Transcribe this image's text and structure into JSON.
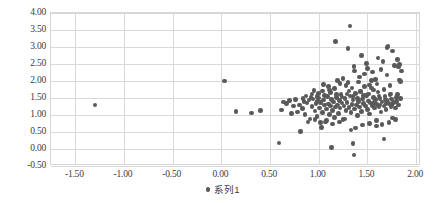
{
  "chart_data": {
    "type": "scatter",
    "title": "",
    "xlabel": "",
    "ylabel": "",
    "xlim": [
      -1.75,
      2.05
    ],
    "ylim": [
      -0.5,
      4.0
    ],
    "grid": true,
    "legend_position": "bottom",
    "marker_color": "#595959",
    "gridline_color": "#d9d9d9",
    "plot_border_color": "#d6d6d6",
    "background_color": "#ffffff",
    "x_ticks": [
      "-1.50",
      "-1.00",
      "-0.50",
      "0.00",
      "0.50",
      "1.00",
      "1.50",
      "2.00"
    ],
    "x_tick_values": [
      -1.5,
      -1.0,
      -0.5,
      0.0,
      0.5,
      1.0,
      1.5,
      2.0
    ],
    "y_ticks": [
      "4.00",
      "3.50",
      "3.00",
      "2.50",
      "2.00",
      "1.50",
      "1.00",
      "0.50",
      "0.00",
      "-0.50"
    ],
    "y_tick_values": [
      4.0,
      3.5,
      3.0,
      2.5,
      2.0,
      1.5,
      1.0,
      0.5,
      0.0,
      -0.5
    ],
    "series": [
      {
        "name": "系列1",
        "marker": "circle",
        "color": "#595959",
        "points": [
          [
            -1.3,
            1.29
          ],
          [
            0.03,
            2.0
          ],
          [
            0.15,
            1.11
          ],
          [
            0.31,
            1.06
          ],
          [
            0.4,
            1.13
          ],
          [
            0.59,
            0.18
          ],
          [
            0.62,
            1.15
          ],
          [
            0.64,
            1.38
          ],
          [
            0.67,
            1.33
          ],
          [
            0.7,
            1.42
          ],
          [
            0.72,
            1.05
          ],
          [
            0.74,
            1.27
          ],
          [
            0.76,
            1.45
          ],
          [
            0.78,
            1.09
          ],
          [
            0.8,
            1.3
          ],
          [
            0.81,
            0.52
          ],
          [
            0.83,
            1.19
          ],
          [
            0.85,
            1.4
          ],
          [
            0.86,
            1.02
          ],
          [
            0.88,
            1.35
          ],
          [
            0.9,
            1.44
          ],
          [
            0.91,
            0.88
          ],
          [
            0.93,
            1.25
          ],
          [
            0.94,
            1.47
          ],
          [
            0.95,
            1.72
          ],
          [
            0.96,
            1.12
          ],
          [
            0.97,
            1.33
          ],
          [
            0.98,
            0.95
          ],
          [
            0.99,
            1.41
          ],
          [
            1.0,
            1.5
          ],
          [
            1.01,
            1.21
          ],
          [
            1.02,
            1.36
          ],
          [
            1.03,
            0.64
          ],
          [
            1.04,
            1.08
          ],
          [
            1.05,
            1.44
          ],
          [
            1.06,
            1.29
          ],
          [
            1.07,
            0.79
          ],
          [
            1.08,
            1.18
          ],
          [
            1.09,
            1.55
          ],
          [
            1.1,
            1.32
          ],
          [
            1.11,
            1.01
          ],
          [
            1.12,
            1.26
          ],
          [
            1.13,
            1.46
          ],
          [
            1.13,
            0.04
          ],
          [
            1.14,
            1.14
          ],
          [
            1.15,
            1.38
          ],
          [
            1.16,
            0.92
          ],
          [
            1.17,
            1.24
          ],
          [
            1.17,
            3.16
          ],
          [
            1.18,
            1.51
          ],
          [
            1.19,
            1.3
          ],
          [
            1.2,
            1.05
          ],
          [
            1.21,
            1.43
          ],
          [
            1.22,
            1.2
          ],
          [
            1.23,
            1.61
          ],
          [
            1.24,
            1.35
          ],
          [
            1.25,
            0.86
          ],
          [
            1.26,
            1.27
          ],
          [
            1.27,
            1.48
          ],
          [
            1.28,
            1.13
          ],
          [
            1.29,
            1.37
          ],
          [
            1.3,
            1.95
          ],
          [
            1.31,
            1.22
          ],
          [
            1.32,
            1.56
          ],
          [
            1.32,
            3.62
          ],
          [
            1.33,
            1.07
          ],
          [
            1.34,
            1.31
          ],
          [
            1.35,
            1.44
          ],
          [
            1.35,
            0.17
          ],
          [
            1.36,
            -0.18
          ],
          [
            1.37,
            1.18
          ],
          [
            1.38,
            1.64
          ],
          [
            1.39,
            1.29
          ],
          [
            1.4,
            0.98
          ],
          [
            1.41,
            1.39
          ],
          [
            1.42,
            1.24
          ],
          [
            1.43,
            1.7
          ],
          [
            1.44,
            1.11
          ],
          [
            1.45,
            1.47
          ],
          [
            1.46,
            1.33
          ],
          [
            1.47,
            2.2
          ],
          [
            1.48,
            1.26
          ],
          [
            1.49,
            1.58
          ],
          [
            1.5,
            1.16
          ],
          [
            1.51,
            1.41
          ],
          [
            1.52,
            1.03
          ],
          [
            1.53,
            1.35
          ],
          [
            1.54,
            1.79
          ],
          [
            1.55,
            1.28
          ],
          [
            1.56,
            1.52
          ],
          [
            1.57,
            1.2
          ],
          [
            1.58,
            1.45
          ],
          [
            1.59,
            0.84
          ],
          [
            1.6,
            1.31
          ],
          [
            1.61,
            1.68
          ],
          [
            1.62,
            1.23
          ],
          [
            1.63,
            1.49
          ],
          [
            1.64,
            1.09
          ],
          [
            1.65,
            1.38
          ],
          [
            1.66,
            2.57
          ],
          [
            1.67,
            1.27
          ],
          [
            1.67,
            0.29
          ],
          [
            1.68,
            1.54
          ],
          [
            1.69,
            1.17
          ],
          [
            1.7,
            1.42
          ],
          [
            1.71,
            3.02
          ],
          [
            1.72,
            1.33
          ],
          [
            1.73,
            1.6
          ],
          [
            1.74,
            1.25
          ],
          [
            1.75,
            1.47
          ],
          [
            1.76,
            0.91
          ],
          [
            1.77,
            1.36
          ],
          [
            1.78,
            2.45
          ],
          [
            1.79,
            1.21
          ],
          [
            1.8,
            1.51
          ],
          [
            1.81,
            2.63
          ],
          [
            1.82,
            1.3
          ],
          [
            1.83,
            2.03
          ],
          [
            1.84,
            1.99
          ],
          [
            1.85,
            2.29
          ],
          [
            1.3,
            2.95
          ],
          [
            1.36,
            2.43
          ],
          [
            1.42,
            2.12
          ],
          [
            1.49,
            2.51
          ],
          [
            1.55,
            2.27
          ],
          [
            1.61,
            2.68
          ],
          [
            1.44,
            2.75
          ],
          [
            1.52,
            1.88
          ],
          [
            1.58,
            2.05
          ],
          [
            1.64,
            2.34
          ],
          [
            1.7,
            2.18
          ],
          [
            1.76,
            2.88
          ],
          [
            1.82,
            2.41
          ],
          [
            1.73,
            1.86
          ],
          [
            1.67,
            1.75
          ],
          [
            1.6,
            1.91
          ],
          [
            1.54,
            2.02
          ],
          [
            1.47,
            1.83
          ],
          [
            1.41,
            1.97
          ],
          [
            1.34,
            1.79
          ],
          [
            1.28,
            1.86
          ],
          [
            1.22,
            1.93
          ],
          [
            1.16,
            1.78
          ],
          [
            1.1,
            1.84
          ],
          [
            1.05,
            1.9
          ],
          [
            1.19,
            2.01
          ],
          [
            1.25,
            2.08
          ],
          [
            1.31,
            1.71
          ],
          [
            1.37,
            2.29
          ],
          [
            1.43,
            1.68
          ],
          [
            1.5,
            2.36
          ],
          [
            1.56,
            1.73
          ],
          [
            1.62,
            1.56
          ],
          [
            1.68,
            1.44
          ],
          [
            1.74,
            1.62
          ],
          [
            1.8,
            1.4
          ],
          [
            1.79,
            0.87
          ],
          [
            1.72,
            0.78
          ],
          [
            1.65,
            0.72
          ],
          [
            1.59,
            0.68
          ],
          [
            1.52,
            0.75
          ],
          [
            1.45,
            0.7
          ],
          [
            1.38,
            0.62
          ],
          [
            1.33,
            0.56
          ],
          [
            1.27,
            0.88
          ],
          [
            1.21,
            0.8
          ],
          [
            1.14,
            0.74
          ],
          [
            1.08,
            0.83
          ],
          [
            1.02,
            0.78
          ],
          [
            0.96,
            0.86
          ],
          [
            0.89,
            0.8
          ],
          [
            0.84,
            1.48
          ],
          [
            0.92,
            1.52
          ],
          [
            1.0,
            1.64
          ],
          [
            1.06,
            1.58
          ],
          [
            1.12,
            1.66
          ],
          [
            1.18,
            1.6
          ],
          [
            1.24,
            1.53
          ],
          [
            1.29,
            1.62
          ],
          [
            1.35,
            1.55
          ],
          [
            1.4,
            1.49
          ],
          [
            1.46,
            1.57
          ],
          [
            1.51,
            1.62
          ],
          [
            1.57,
            1.37
          ],
          [
            1.63,
            1.3
          ],
          [
            1.69,
            1.34
          ],
          [
            1.75,
            1.28
          ],
          [
            1.81,
            1.6
          ],
          [
            1.84,
            1.48
          ],
          [
            1.83,
            2.49
          ],
          [
            1.7,
            2.99
          ],
          [
            1.11,
            1.73
          ],
          [
            1.04,
            1.7
          ],
          [
            0.98,
            1.55
          ],
          [
            0.93,
            1.62
          ],
          [
            0.87,
            1.56
          ]
        ]
      }
    ]
  },
  "legend": {
    "marker_name": "series-marker",
    "label": "系列1"
  }
}
